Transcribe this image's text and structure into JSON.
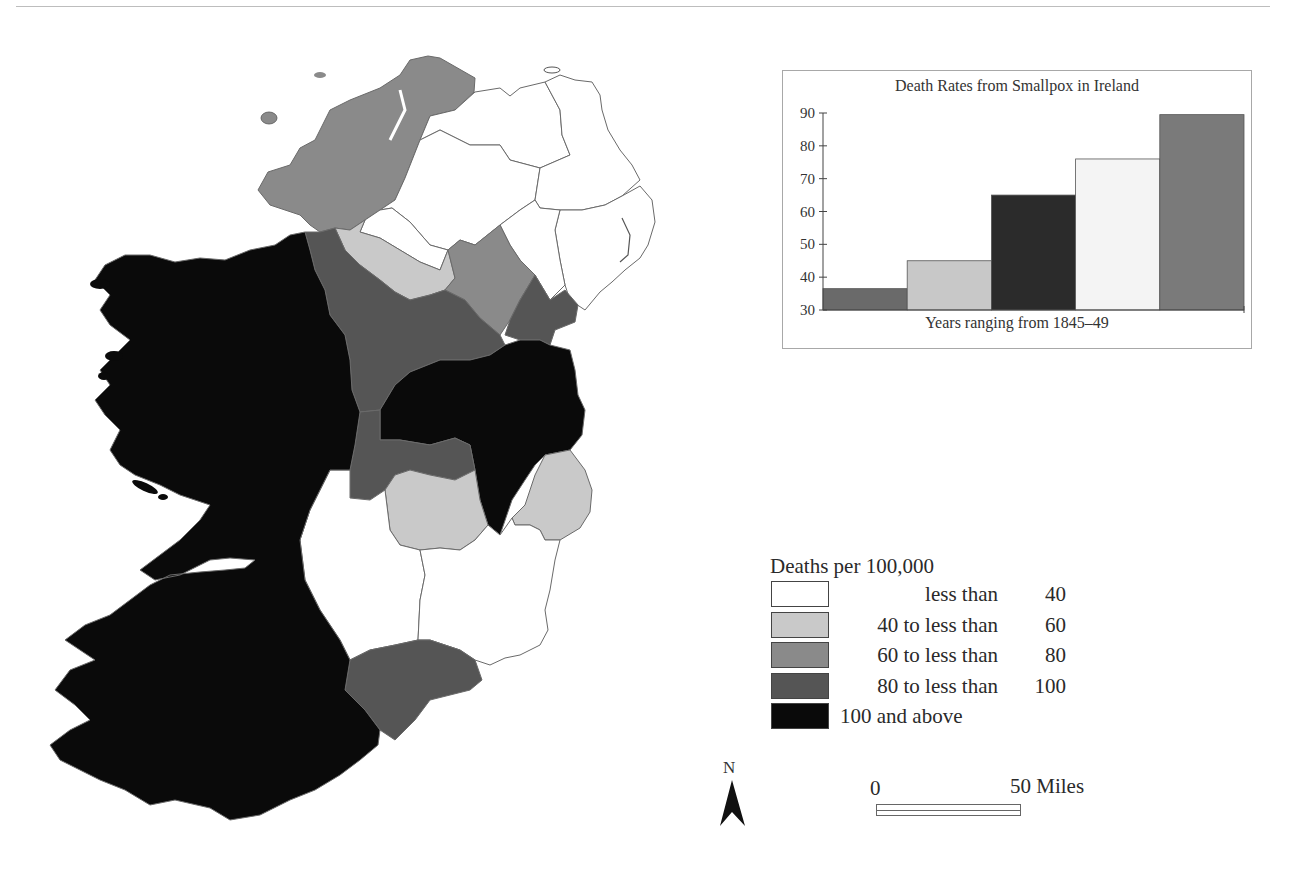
{
  "map": {
    "title": "Deaths per 100,000 from Smallpox by County, Ireland",
    "colors": {
      "lt40": "#ffffff",
      "40to60": "#c9c9c9",
      "60to80": "#8a8a8a",
      "80to100": "#555555",
      "gte100": "#0a0a0a"
    }
  },
  "chart_data": {
    "type": "bar",
    "title": "Death Rates from Smallpox in Ireland",
    "xlabel": "Years ranging from 1845–49",
    "ylabel": "",
    "categories": [
      "1845",
      "1846",
      "1847",
      "1848",
      "1849"
    ],
    "values": [
      36.5,
      45,
      65,
      76,
      89.5
    ],
    "bar_colors": [
      "#6a6a6a",
      "#c8c8c8",
      "#2b2b2b",
      "#f4f4f4",
      "#7a7a7a"
    ],
    "ylim": [
      30,
      90
    ],
    "yticks": [
      30,
      40,
      50,
      60,
      70,
      80,
      90
    ],
    "grid": false,
    "legend": "none"
  },
  "legend": {
    "title": "Deaths per 100,000",
    "items": [
      {
        "label_left": "",
        "label_mid": "less than",
        "label_right": "40",
        "color": "#ffffff"
      },
      {
        "label_left": "40 to",
        "label_mid": "less than",
        "label_right": "60",
        "color": "#c9c9c9"
      },
      {
        "label_left": "60 to",
        "label_mid": "less than",
        "label_right": "80",
        "color": "#8a8a8a"
      },
      {
        "label_left": "80 to",
        "label_mid": "less than",
        "label_right": "100",
        "color": "#555555"
      },
      {
        "label_left": "100 and above",
        "label_mid": "",
        "label_right": "",
        "color": "#0a0a0a"
      }
    ]
  },
  "north_arrow": {
    "label": "N"
  },
  "scale_bar": {
    "start_label": "0",
    "end_label": "50 Miles"
  }
}
